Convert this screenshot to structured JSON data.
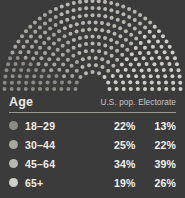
{
  "background_color": "#3b3b3b",
  "arc": {
    "name": "semicircle-dot-arc",
    "description": "Half-donut dot diagram, dots colored by age group",
    "center_x": 92.5,
    "center_y": 89,
    "inner_radius": 17,
    "outer_radius": 88,
    "rings": 11,
    "dot_radius": 2.0
  },
  "table": {
    "header": {
      "age_label": "Age",
      "us_pop_label": "U.S. pop.",
      "electorate_label": "Electorate"
    },
    "rows": [
      {
        "age": "18–29",
        "us_pop": "22%",
        "electorate": "13%",
        "color": "#8d8b87"
      },
      {
        "age": "30–44",
        "us_pop": "25%",
        "electorate": "22%",
        "color": "#a7a5a0"
      },
      {
        "age": "45–64",
        "us_pop": "34%",
        "electorate": "39%",
        "color": "#b8b6b1"
      },
      {
        "age": "65+",
        "us_pop": "19%",
        "electorate": "26%",
        "color": "#cfcdc8"
      }
    ]
  },
  "chart_data": {
    "type": "pie",
    "title": "Age",
    "subtitle": "",
    "xlabel": "",
    "ylabel": "",
    "categories": [
      "18–29",
      "30–44",
      "45–64",
      "65+"
    ],
    "series": [
      {
        "name": "U.S. pop.",
        "values": [
          22,
          25,
          34,
          19
        ]
      },
      {
        "name": "Electorate",
        "values": [
          13,
          22,
          39,
          26
        ]
      }
    ],
    "displayed_series": "Electorate",
    "slice_colors": [
      "#8d8b87",
      "#a7a5a0",
      "#b8b6b1",
      "#cfcdc8"
    ],
    "units": "percent",
    "legend_position": "table-left",
    "grid": false,
    "note": "Half-donut dot plot; arc spans 180 degrees left-to-right"
  }
}
